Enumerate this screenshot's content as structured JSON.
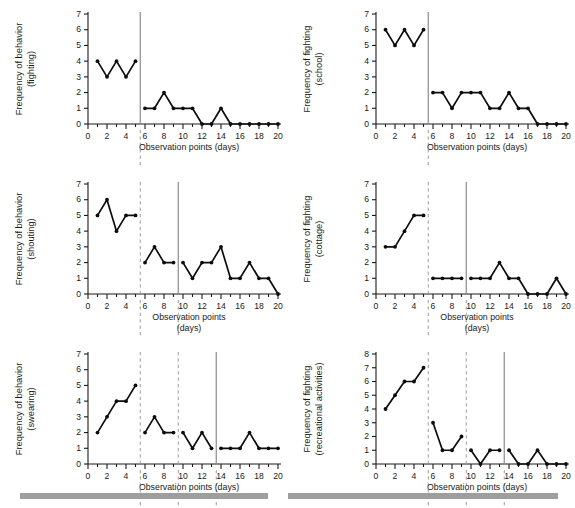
{
  "figure": {
    "title": "",
    "xlabel_common": "Observation points (days)",
    "footer_bars": 2
  },
  "chart_data": [
    {
      "id": "panel-fighting-behavior",
      "type": "line",
      "title": "",
      "ylabel_line1": "Frequency of behavior",
      "ylabel_line2": "(fighting)",
      "xlabel": "Observation points (days)",
      "xlabel_line2": "",
      "xlim": [
        0,
        20
      ],
      "ylim": [
        0,
        7
      ],
      "yticks": [
        0,
        1,
        2,
        3,
        4,
        5,
        6,
        7
      ],
      "xticks": [
        0,
        2,
        4,
        6,
        8,
        10,
        12,
        14,
        16,
        18,
        20
      ],
      "grid": false,
      "legend": "none",
      "phase_lines": [
        {
          "x": 5.5,
          "style": "solid"
        }
      ],
      "segments": [
        {
          "x": [
            1,
            2,
            3,
            4,
            5
          ],
          "y": [
            4,
            3,
            4,
            3,
            4
          ]
        },
        {
          "x": [
            6,
            7,
            8,
            9,
            10,
            11,
            12,
            13,
            14,
            15,
            16,
            17,
            18,
            19,
            20
          ],
          "y": [
            1,
            1,
            2,
            1,
            1,
            1,
            0,
            0,
            1,
            0,
            0,
            0,
            0,
            0,
            0
          ]
        }
      ]
    },
    {
      "id": "panel-fighting-school",
      "type": "line",
      "title": "",
      "ylabel_line1": "Frequency of fighting",
      "ylabel_line2": "(school)",
      "xlabel": "Observation points (days)",
      "xlabel_line2": "",
      "xlim": [
        0,
        20
      ],
      "ylim": [
        0,
        7
      ],
      "yticks": [
        0,
        1,
        2,
        3,
        4,
        5,
        6,
        7
      ],
      "xticks": [
        0,
        2,
        4,
        6,
        8,
        10,
        12,
        14,
        16,
        18,
        20
      ],
      "grid": false,
      "legend": "none",
      "phase_lines": [
        {
          "x": 5.5,
          "style": "solid"
        }
      ],
      "segments": [
        {
          "x": [
            1,
            2,
            3,
            4,
            5
          ],
          "y": [
            6,
            5,
            6,
            5,
            6
          ]
        },
        {
          "x": [
            6,
            7,
            8,
            9,
            10,
            11,
            12,
            13,
            14,
            15,
            16,
            17,
            18,
            19,
            20
          ],
          "y": [
            2,
            2,
            1,
            2,
            2,
            2,
            1,
            1,
            2,
            1,
            1,
            0,
            0,
            0,
            0
          ]
        }
      ]
    },
    {
      "id": "panel-shouting-behavior",
      "type": "line",
      "title": "",
      "ylabel_line1": "Frequency of behavior",
      "ylabel_line2": "(shouting)",
      "xlabel": "Observation points",
      "xlabel_line2": "(days)",
      "xlim": [
        0,
        20
      ],
      "ylim": [
        0,
        7
      ],
      "yticks": [
        0,
        1,
        2,
        3,
        4,
        5,
        6,
        7
      ],
      "xticks": [
        0,
        2,
        4,
        6,
        8,
        10,
        12,
        14,
        16,
        18,
        20
      ],
      "grid": false,
      "legend": "none",
      "phase_lines": [
        {
          "x": 5.5,
          "style": "dashed"
        },
        {
          "x": 9.5,
          "style": "solid"
        }
      ],
      "segments": [
        {
          "x": [
            1,
            2,
            3,
            4,
            5
          ],
          "y": [
            5,
            6,
            4,
            5,
            5
          ]
        },
        {
          "x": [
            6,
            7,
            8,
            9
          ],
          "y": [
            2,
            3,
            2,
            2
          ]
        },
        {
          "x": [
            10,
            11,
            12,
            13,
            14,
            15,
            16,
            17,
            18,
            19,
            20
          ],
          "y": [
            2,
            1,
            2,
            2,
            3,
            1,
            1,
            2,
            1,
            1,
            0
          ]
        }
      ]
    },
    {
      "id": "panel-fighting-cottage",
      "type": "line",
      "title": "",
      "ylabel_line1": "Frequency of fighting",
      "ylabel_line2": "(cottage)",
      "xlabel": "Observation points",
      "xlabel_line2": "(days)",
      "xlim": [
        0,
        20
      ],
      "ylim": [
        0,
        7
      ],
      "yticks": [
        0,
        1,
        2,
        3,
        4,
        5,
        6,
        7
      ],
      "xticks": [
        0,
        2,
        4,
        6,
        8,
        10,
        12,
        14,
        16,
        18,
        20
      ],
      "grid": false,
      "legend": "none",
      "phase_lines": [
        {
          "x": 5.5,
          "style": "dashed"
        },
        {
          "x": 9.5,
          "style": "solid"
        }
      ],
      "segments": [
        {
          "x": [
            1,
            2,
            3,
            4,
            5
          ],
          "y": [
            3,
            3,
            4,
            5,
            5
          ]
        },
        {
          "x": [
            6,
            7,
            8,
            9
          ],
          "y": [
            1,
            1,
            1,
            1
          ]
        },
        {
          "x": [
            10,
            11,
            12,
            13,
            14,
            15,
            16,
            17,
            18,
            19,
            20
          ],
          "y": [
            1,
            1,
            1,
            2,
            1,
            1,
            0,
            0,
            0,
            1,
            0
          ]
        }
      ]
    },
    {
      "id": "panel-swearing-behavior",
      "type": "line",
      "title": "",
      "ylabel_line1": "Frequency of behavior",
      "ylabel_line2": "(swearing)",
      "xlabel": "Observation points (days)",
      "xlabel_line2": "",
      "xlim": [
        0,
        20
      ],
      "ylim": [
        0,
        7
      ],
      "yticks": [
        0,
        1,
        2,
        3,
        4,
        5,
        6,
        7
      ],
      "xticks": [
        0,
        2,
        4,
        6,
        8,
        10,
        12,
        14,
        16,
        18,
        20
      ],
      "grid": false,
      "legend": "none",
      "phase_lines": [
        {
          "x": 5.5,
          "style": "dashed"
        },
        {
          "x": 9.5,
          "style": "dashed"
        },
        {
          "x": 13.5,
          "style": "solid"
        }
      ],
      "segments": [
        {
          "x": [
            1,
            2,
            3,
            4,
            5
          ],
          "y": [
            2,
            3,
            4,
            4,
            5
          ]
        },
        {
          "x": [
            6,
            7,
            8,
            9
          ],
          "y": [
            2,
            3,
            2,
            2
          ]
        },
        {
          "x": [
            10,
            11,
            12,
            13
          ],
          "y": [
            2,
            1,
            2,
            1
          ]
        },
        {
          "x": [
            14,
            15,
            16,
            17,
            18,
            19,
            20
          ],
          "y": [
            1,
            1,
            1,
            2,
            1,
            1,
            1
          ]
        }
      ]
    },
    {
      "id": "panel-fighting-recreational",
      "type": "line",
      "title": "",
      "ylabel_line1": "Frequency of fighting",
      "ylabel_line2": "(recreational activities)",
      "xlabel": "Observation points (days)",
      "xlabel_line2": "",
      "xlim": [
        0,
        20
      ],
      "ylim": [
        0,
        8
      ],
      "yticks": [
        0,
        1,
        2,
        3,
        4,
        5,
        6,
        7,
        8
      ],
      "xticks": [
        0,
        2,
        4,
        6,
        8,
        10,
        12,
        14,
        16,
        18,
        20
      ],
      "grid": false,
      "legend": "none",
      "phase_lines": [
        {
          "x": 5.5,
          "style": "dashed"
        },
        {
          "x": 9.5,
          "style": "dashed"
        },
        {
          "x": 13.5,
          "style": "solid"
        }
      ],
      "segments": [
        {
          "x": [
            1,
            2,
            3,
            4,
            5
          ],
          "y": [
            4,
            5,
            6,
            6,
            7
          ]
        },
        {
          "x": [
            6,
            7,
            8,
            9
          ],
          "y": [
            3,
            1,
            1,
            2
          ]
        },
        {
          "x": [
            10,
            11,
            12,
            13
          ],
          "y": [
            1,
            0,
            1,
            1
          ]
        },
        {
          "x": [
            14,
            15,
            16,
            17,
            18,
            19,
            20
          ],
          "y": [
            1,
            0,
            0,
            1,
            0,
            0,
            0
          ]
        }
      ]
    }
  ]
}
